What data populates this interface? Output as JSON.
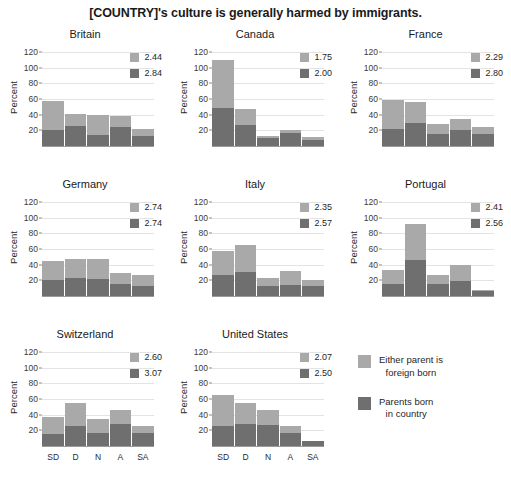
{
  "title": "[COUNTRY]'s culture is generally harmed by immigrants.",
  "axis": {
    "ylabel": "Percent",
    "yticks": [
      "20",
      "40",
      "60",
      "80",
      "100",
      "120"
    ],
    "ylim": [
      0,
      125
    ],
    "xticklabels": [
      "SD",
      "D",
      "N",
      "A",
      "SA"
    ]
  },
  "colors": {
    "light": "#a9a9a9",
    "dark": "#6f6f6f",
    "grid": "#e3e3e3",
    "text": "#1f1f1f",
    "background": "#ffffff"
  },
  "legend": {
    "items": [
      {
        "swatch": "light",
        "line1": "Either parent is",
        "line2": "foreign born"
      },
      {
        "swatch": "dark",
        "line1": "Parents born",
        "line2": "in country"
      }
    ]
  },
  "panels": [
    {
      "title": "Britain",
      "means": {
        "light": "2.44",
        "dark": "2.84"
      },
      "dark_values": [
        20,
        26,
        14,
        24,
        13
      ],
      "light_values": [
        37,
        15,
        25,
        14,
        9
      ],
      "total_values": [
        57,
        41,
        39,
        38,
        22
      ]
    },
    {
      "title": "Canada",
      "means": {
        "light": "1.75",
        "dark": "2.00"
      },
      "dark_values": [
        49,
        27,
        10,
        17,
        8
      ],
      "light_values": [
        61,
        20,
        3,
        3,
        3
      ],
      "total_values": [
        110,
        47,
        13,
        20,
        11
      ]
    },
    {
      "title": "France",
      "means": {
        "light": "2.29",
        "dark": "2.80"
      },
      "dark_values": [
        22,
        29,
        15,
        20,
        15
      ],
      "light_values": [
        37,
        27,
        13,
        14,
        9
      ],
      "total_values": [
        59,
        56,
        28,
        34,
        24
      ]
    },
    {
      "title": "Germany",
      "means": {
        "light": "2.74",
        "dark": "2.74"
      },
      "dark_values": [
        21,
        23,
        22,
        15,
        13
      ],
      "light_values": [
        24,
        24,
        25,
        15,
        14
      ],
      "total_values": [
        45,
        47,
        47,
        30,
        27
      ]
    },
    {
      "title": "Italy",
      "means": {
        "light": "2.35",
        "dark": "2.57"
      },
      "dark_values": [
        27,
        31,
        13,
        14,
        13
      ],
      "light_values": [
        31,
        34,
        10,
        18,
        7
      ],
      "total_values": [
        58,
        65,
        23,
        32,
        20
      ]
    },
    {
      "title": "Portugal",
      "means": {
        "light": "2.41",
        "dark": "2.56"
      },
      "dark_values": [
        15,
        46,
        15,
        19,
        7
      ],
      "light_values": [
        18,
        46,
        12,
        20,
        1
      ],
      "total_values": [
        33,
        92,
        27,
        39,
        8
      ]
    },
    {
      "title": "Switzerland",
      "means": {
        "light": "2.60",
        "dark": "3.07"
      },
      "dark_values": [
        15,
        25,
        17,
        28,
        16
      ],
      "light_values": [
        22,
        30,
        18,
        18,
        9
      ],
      "total_values": [
        37,
        55,
        35,
        46,
        25
      ]
    },
    {
      "title": "United States",
      "means": {
        "light": "2.07",
        "dark": "2.50"
      },
      "dark_values": [
        25,
        28,
        27,
        17,
        6
      ],
      "light_values": [
        40,
        27,
        19,
        8,
        1
      ],
      "total_values": [
        65,
        55,
        46,
        25,
        7
      ]
    }
  ],
  "chart_data": {
    "type": "bar",
    "title": "[COUNTRY]'s culture is generally harmed by immigrants.",
    "subtitle": "",
    "xlabel": "",
    "ylabel": "Percent",
    "ylim": [
      0,
      125
    ],
    "yticks": [
      20,
      40,
      60,
      80,
      100,
      120
    ],
    "grid": true,
    "stacked": true,
    "legend_position": "bottom-right",
    "categories": [
      "SD",
      "D",
      "N",
      "A",
      "SA"
    ],
    "category_full_names": [
      "Strongly Disagree",
      "Disagree",
      "Neutral",
      "Agree",
      "Strongly Agree"
    ],
    "legend_entries": [
      "Either parent is foreign born",
      "Parents born in country"
    ],
    "panels": [
      {
        "name": "Britain",
        "mean_foreign_born": 2.44,
        "mean_native_born": 2.84,
        "series": [
          {
            "name": "Parents born in country",
            "values": [
              20,
              26,
              14,
              24,
              13
            ]
          },
          {
            "name": "Either parent is foreign born",
            "values": [
              37,
              15,
              25,
              14,
              9
            ]
          }
        ],
        "totals": [
          57,
          41,
          39,
          38,
          22
        ]
      },
      {
        "name": "Canada",
        "mean_foreign_born": 1.75,
        "mean_native_born": 2.0,
        "series": [
          {
            "name": "Parents born in country",
            "values": [
              49,
              27,
              10,
              17,
              8
            ]
          },
          {
            "name": "Either parent is foreign born",
            "values": [
              61,
              20,
              3,
              3,
              3
            ]
          }
        ],
        "totals": [
          110,
          47,
          13,
          20,
          11
        ]
      },
      {
        "name": "France",
        "mean_foreign_born": 2.29,
        "mean_native_born": 2.8,
        "series": [
          {
            "name": "Parents born in country",
            "values": [
              22,
              29,
              15,
              20,
              15
            ]
          },
          {
            "name": "Either parent is foreign born",
            "values": [
              37,
              27,
              13,
              14,
              9
            ]
          }
        ],
        "totals": [
          59,
          56,
          28,
          34,
          24
        ]
      },
      {
        "name": "Germany",
        "mean_foreign_born": 2.74,
        "mean_native_born": 2.74,
        "series": [
          {
            "name": "Parents born in country",
            "values": [
              21,
              23,
              22,
              15,
              13
            ]
          },
          {
            "name": "Either parent is foreign born",
            "values": [
              24,
              24,
              25,
              15,
              14
            ]
          }
        ],
        "totals": [
          45,
          47,
          47,
          30,
          27
        ]
      },
      {
        "name": "Italy",
        "mean_foreign_born": 2.35,
        "mean_native_born": 2.57,
        "series": [
          {
            "name": "Parents born in country",
            "values": [
              27,
              31,
              13,
              14,
              13
            ]
          },
          {
            "name": "Either parent is foreign born",
            "values": [
              31,
              34,
              10,
              18,
              7
            ]
          }
        ],
        "totals": [
          58,
          65,
          23,
          32,
          20
        ]
      },
      {
        "name": "Portugal",
        "mean_foreign_born": 2.41,
        "mean_native_born": 2.56,
        "series": [
          {
            "name": "Parents born in country",
            "values": [
              15,
              46,
              15,
              19,
              7
            ]
          },
          {
            "name": "Either parent is foreign born",
            "values": [
              18,
              46,
              12,
              20,
              1
            ]
          }
        ],
        "totals": [
          33,
          92,
          27,
          39,
          8
        ]
      },
      {
        "name": "Switzerland",
        "mean_foreign_born": 2.6,
        "mean_native_born": 3.07,
        "series": [
          {
            "name": "Parents born in country",
            "values": [
              15,
              25,
              17,
              28,
              16
            ]
          },
          {
            "name": "Either parent is foreign born",
            "values": [
              22,
              30,
              18,
              18,
              9
            ]
          }
        ],
        "totals": [
          37,
          55,
          35,
          46,
          25
        ]
      },
      {
        "name": "United States",
        "mean_foreign_born": 2.07,
        "mean_native_born": 2.5,
        "series": [
          {
            "name": "Parents born in country",
            "values": [
              25,
              28,
              27,
              17,
              6
            ]
          },
          {
            "name": "Either parent is foreign born",
            "values": [
              40,
              27,
              19,
              8,
              1
            ]
          }
        ],
        "totals": [
          65,
          55,
          46,
          25,
          7
        ]
      }
    ]
  }
}
